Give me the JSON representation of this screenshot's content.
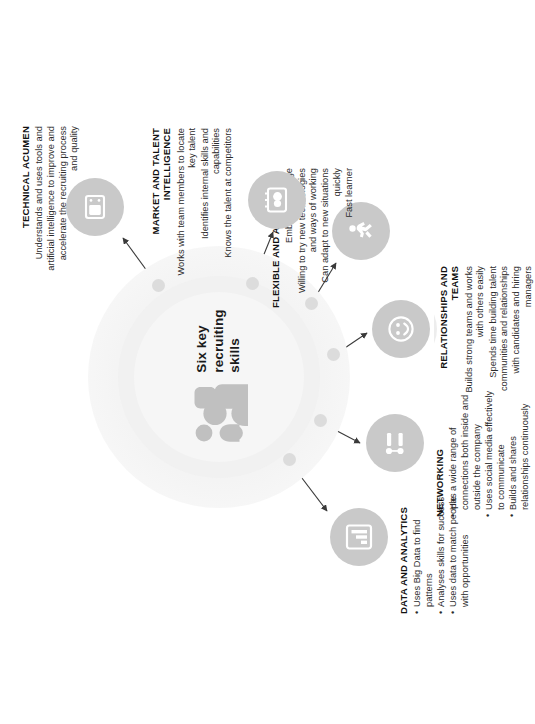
{
  "hub": {
    "title": "Six key\nrecruiting\nskills",
    "icon": "group-of-people-icon"
  },
  "colors": {
    "node_fill": "#c9c9c9",
    "halo": "#dedede",
    "hub_glow": "#f0f0f0",
    "heading_text": "#111111",
    "body_text": "#2b2b2b",
    "connector": "#3a3a3a"
  },
  "skills": [
    {
      "id": "data-and-analytics",
      "heading": "DATA AND ANALYTICS",
      "icon": "bar-chart-icon",
      "bullets": [
        "Uses Big Data to find patterns",
        "Analyses skills for success",
        "Uses data to match people with opportunities"
      ]
    },
    {
      "id": "networking",
      "heading": "NETWORKING",
      "icon": "network-people-icon",
      "bullets": [
        "Has a wide range of connections both inside and outside the company",
        "Uses social media effectively to communicate",
        "Builds and shares relationships continuously"
      ]
    },
    {
      "id": "relationships-and-teams",
      "heading": "RELATIONSHIPS AND TEAMS",
      "icon": "smiley-face-icon",
      "bullets": [
        "Builds strong teams and works with others easily",
        "Spends time building talent communities and relationships with candidates and hiring managers"
      ]
    },
    {
      "id": "flexible-and-agile",
      "heading": "FLEXIBLE AND AGILE",
      "icon": "running-figure-icon",
      "bullets": [
        "Embraces change",
        "Willing to try new technologies and ways of working",
        "Can adapt to new situations quickly",
        "Fast learner"
      ]
    },
    {
      "id": "market-and-talent-intelligence",
      "heading": "MARKET AND TALENT INTELLIGENCE",
      "icon": "presentation-board-icon",
      "bullets": [
        "Works with team members to locate key talent",
        "Identifies internal skills and capabilities",
        "Knows the talent at competitors"
      ]
    },
    {
      "id": "technical-acumen",
      "heading": "TECHNICAL ACUMEN",
      "icon": "laptop-icon",
      "bullets": [
        "Understands and uses tools and artificial intelligence to improve and accelerate the recruiting process and quality"
      ]
    }
  ]
}
